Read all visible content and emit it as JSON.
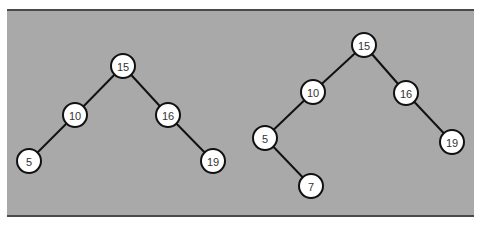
{
  "colors": {
    "panel_background": "#a9a9a9",
    "panel_border": "#4a4a4a",
    "node_fill": "#ffffff",
    "node_stroke": "#111111",
    "edge": "#111111"
  },
  "trees": [
    {
      "name": "left-tree",
      "nodes": [
        {
          "id": "L15",
          "label": "15",
          "x": 123,
          "y": 66
        },
        {
          "id": "L10",
          "label": "10",
          "x": 75,
          "y": 115
        },
        {
          "id": "L16",
          "label": "16",
          "x": 168,
          "y": 115
        },
        {
          "id": "L5",
          "label": "5",
          "x": 29,
          "y": 161
        },
        {
          "id": "L19",
          "label": "19",
          "x": 213,
          "y": 161
        }
      ],
      "edges": [
        [
          "L15",
          "L10"
        ],
        [
          "L15",
          "L16"
        ],
        [
          "L10",
          "L5"
        ],
        [
          "L16",
          "L19"
        ]
      ]
    },
    {
      "name": "right-tree",
      "nodes": [
        {
          "id": "R15",
          "label": "15",
          "x": 364,
          "y": 45
        },
        {
          "id": "R10",
          "label": "10",
          "x": 313,
          "y": 92
        },
        {
          "id": "R16",
          "label": "16",
          "x": 406,
          "y": 93
        },
        {
          "id": "R5",
          "label": "5",
          "x": 265,
          "y": 138
        },
        {
          "id": "R19",
          "label": "19",
          "x": 452,
          "y": 142
        },
        {
          "id": "R7",
          "label": "7",
          "x": 311,
          "y": 186
        }
      ],
      "edges": [
        [
          "R15",
          "R10"
        ],
        [
          "R15",
          "R16"
        ],
        [
          "R10",
          "R5"
        ],
        [
          "R16",
          "R19"
        ],
        [
          "R5",
          "R7"
        ]
      ]
    }
  ]
}
